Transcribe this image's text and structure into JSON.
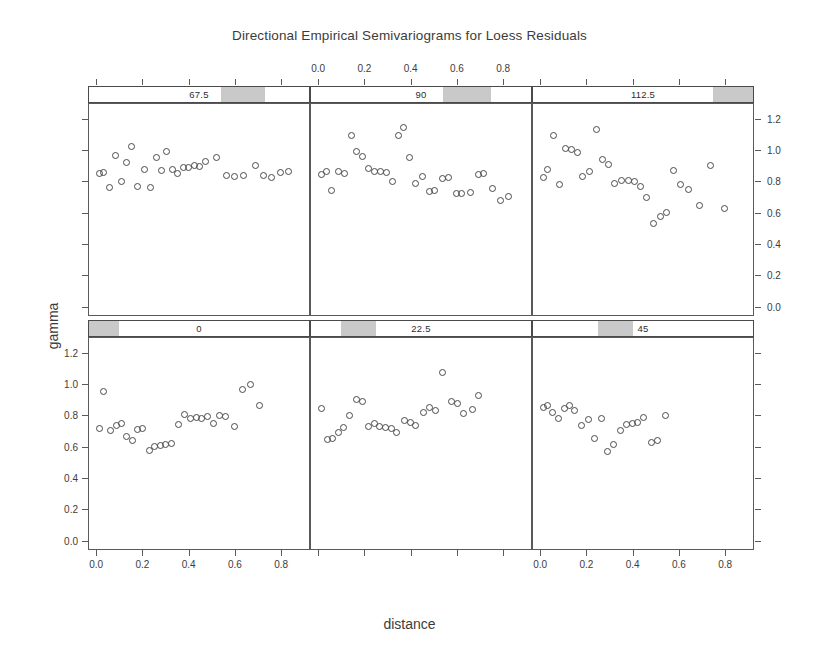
{
  "chart_data": {
    "type": "scatter",
    "title": "Directional Empirical Semivariograms for Loess Residuals",
    "xlabel": "distance",
    "ylabel": "gamma",
    "layout": {
      "rows": 2,
      "cols": 3,
      "grid": false,
      "legend": "none"
    },
    "xlim": [
      -0.035,
      0.925
    ],
    "ylim": [
      -0.06,
      1.3
    ],
    "xticks": [
      0.0,
      0.2,
      0.4,
      0.6,
      0.8
    ],
    "xticklabels": [
      "0.0",
      "0.2",
      "0.4",
      "0.6",
      "0.8"
    ],
    "yticks": [
      0.0,
      0.2,
      0.4,
      0.6,
      0.8,
      1.0,
      1.2
    ],
    "yticklabels": [
      "0.0",
      "0.2",
      "0.4",
      "0.6",
      "0.8",
      "1.0",
      "1.2"
    ],
    "axis_sides": {
      "x_top_panel": "90",
      "x_bottom_panels": [
        "0",
        "45"
      ],
      "y_left_panel": "0",
      "y_right_panel": "112.5"
    },
    "panels": [
      {
        "strip_label": "67.5",
        "row": 0,
        "col": 0,
        "strip_fill_start": 0.6,
        "strip_fill_end": 0.8,
        "points": [
          {
            "x": 0.01,
            "y": 0.855
          },
          {
            "x": 0.028,
            "y": 0.858
          },
          {
            "x": 0.055,
            "y": 0.762
          },
          {
            "x": 0.082,
            "y": 0.968
          },
          {
            "x": 0.105,
            "y": 0.802
          },
          {
            "x": 0.128,
            "y": 0.922
          },
          {
            "x": 0.152,
            "y": 1.025
          },
          {
            "x": 0.175,
            "y": 0.768
          },
          {
            "x": 0.205,
            "y": 0.88
          },
          {
            "x": 0.232,
            "y": 0.76
          },
          {
            "x": 0.258,
            "y": 0.952
          },
          {
            "x": 0.282,
            "y": 0.872
          },
          {
            "x": 0.305,
            "y": 0.995
          },
          {
            "x": 0.33,
            "y": 0.875
          },
          {
            "x": 0.352,
            "y": 0.852
          },
          {
            "x": 0.378,
            "y": 0.888
          },
          {
            "x": 0.4,
            "y": 0.892
          },
          {
            "x": 0.425,
            "y": 0.905
          },
          {
            "x": 0.448,
            "y": 0.9
          },
          {
            "x": 0.472,
            "y": 0.93
          },
          {
            "x": 0.52,
            "y": 0.955
          },
          {
            "x": 0.565,
            "y": 0.838
          },
          {
            "x": 0.6,
            "y": 0.832
          },
          {
            "x": 0.64,
            "y": 0.838
          },
          {
            "x": 0.69,
            "y": 0.905
          },
          {
            "x": 0.728,
            "y": 0.842
          },
          {
            "x": 0.762,
            "y": 0.828
          },
          {
            "x": 0.8,
            "y": 0.858
          },
          {
            "x": 0.835,
            "y": 0.862
          }
        ]
      },
      {
        "strip_label": "90",
        "row": 0,
        "col": 1,
        "strip_fill_start": 0.6,
        "strip_fill_end": 0.82,
        "points": [
          {
            "x": 0.012,
            "y": 0.845
          },
          {
            "x": 0.032,
            "y": 0.862
          },
          {
            "x": 0.055,
            "y": 0.742
          },
          {
            "x": 0.085,
            "y": 0.868
          },
          {
            "x": 0.11,
            "y": 0.855
          },
          {
            "x": 0.14,
            "y": 1.1
          },
          {
            "x": 0.165,
            "y": 0.995
          },
          {
            "x": 0.19,
            "y": 0.962
          },
          {
            "x": 0.218,
            "y": 0.882
          },
          {
            "x": 0.242,
            "y": 0.868
          },
          {
            "x": 0.268,
            "y": 0.862
          },
          {
            "x": 0.295,
            "y": 0.858
          },
          {
            "x": 0.32,
            "y": 0.8
          },
          {
            "x": 0.345,
            "y": 1.095
          },
          {
            "x": 0.368,
            "y": 1.15
          },
          {
            "x": 0.395,
            "y": 0.952
          },
          {
            "x": 0.42,
            "y": 0.79
          },
          {
            "x": 0.45,
            "y": 0.835
          },
          {
            "x": 0.482,
            "y": 0.738
          },
          {
            "x": 0.505,
            "y": 0.742
          },
          {
            "x": 0.54,
            "y": 0.82
          },
          {
            "x": 0.565,
            "y": 0.828
          },
          {
            "x": 0.598,
            "y": 0.722
          },
          {
            "x": 0.62,
            "y": 0.725
          },
          {
            "x": 0.66,
            "y": 0.732
          },
          {
            "x": 0.695,
            "y": 0.845
          },
          {
            "x": 0.718,
            "y": 0.855
          },
          {
            "x": 0.755,
            "y": 0.755
          },
          {
            "x": 0.79,
            "y": 0.68
          },
          {
            "x": 0.825,
            "y": 0.705
          }
        ]
      },
      {
        "strip_label": "112.5",
        "row": 0,
        "col": 2,
        "strip_fill_start": 0.82,
        "strip_fill_end": 1.0,
        "points": [
          {
            "x": 0.01,
            "y": 0.828
          },
          {
            "x": 0.03,
            "y": 0.88
          },
          {
            "x": 0.055,
            "y": 1.098
          },
          {
            "x": 0.082,
            "y": 0.78
          },
          {
            "x": 0.105,
            "y": 1.012
          },
          {
            "x": 0.132,
            "y": 1.005
          },
          {
            "x": 0.158,
            "y": 0.985
          },
          {
            "x": 0.182,
            "y": 0.832
          },
          {
            "x": 0.21,
            "y": 0.868
          },
          {
            "x": 0.24,
            "y": 1.138
          },
          {
            "x": 0.268,
            "y": 0.942
          },
          {
            "x": 0.295,
            "y": 0.912
          },
          {
            "x": 0.322,
            "y": 0.79
          },
          {
            "x": 0.352,
            "y": 0.805
          },
          {
            "x": 0.382,
            "y": 0.805
          },
          {
            "x": 0.408,
            "y": 0.8
          },
          {
            "x": 0.435,
            "y": 0.768
          },
          {
            "x": 0.462,
            "y": 0.7
          },
          {
            "x": 0.492,
            "y": 0.528
          },
          {
            "x": 0.522,
            "y": 0.572
          },
          {
            "x": 0.548,
            "y": 0.602
          },
          {
            "x": 0.578,
            "y": 0.872
          },
          {
            "x": 0.608,
            "y": 0.782
          },
          {
            "x": 0.645,
            "y": 0.752
          },
          {
            "x": 0.69,
            "y": 0.645
          },
          {
            "x": 0.74,
            "y": 0.905
          },
          {
            "x": 0.8,
            "y": 0.628
          }
        ]
      },
      {
        "strip_label": "0",
        "row": 1,
        "col": 0,
        "strip_fill_start": 0.0,
        "strip_fill_end": 0.135,
        "points": [
          {
            "x": 0.01,
            "y": 0.718
          },
          {
            "x": 0.03,
            "y": 0.952
          },
          {
            "x": 0.058,
            "y": 0.705
          },
          {
            "x": 0.085,
            "y": 0.735
          },
          {
            "x": 0.108,
            "y": 0.752
          },
          {
            "x": 0.13,
            "y": 0.668
          },
          {
            "x": 0.155,
            "y": 0.638
          },
          {
            "x": 0.178,
            "y": 0.712
          },
          {
            "x": 0.2,
            "y": 0.715
          },
          {
            "x": 0.228,
            "y": 0.578
          },
          {
            "x": 0.252,
            "y": 0.598
          },
          {
            "x": 0.275,
            "y": 0.608
          },
          {
            "x": 0.298,
            "y": 0.612
          },
          {
            "x": 0.325,
            "y": 0.622
          },
          {
            "x": 0.355,
            "y": 0.745
          },
          {
            "x": 0.382,
            "y": 0.805
          },
          {
            "x": 0.408,
            "y": 0.782
          },
          {
            "x": 0.432,
            "y": 0.79
          },
          {
            "x": 0.458,
            "y": 0.782
          },
          {
            "x": 0.482,
            "y": 0.795
          },
          {
            "x": 0.508,
            "y": 0.752
          },
          {
            "x": 0.535,
            "y": 0.802
          },
          {
            "x": 0.562,
            "y": 0.795
          },
          {
            "x": 0.598,
            "y": 0.732
          },
          {
            "x": 0.635,
            "y": 0.968
          },
          {
            "x": 0.668,
            "y": 0.998
          },
          {
            "x": 0.71,
            "y": 0.862
          }
        ]
      },
      {
        "strip_label": "22.5",
        "row": 1,
        "col": 1,
        "strip_fill_start": 0.135,
        "strip_fill_end": 0.295,
        "points": [
          {
            "x": 0.012,
            "y": 0.845
          },
          {
            "x": 0.035,
            "y": 0.648
          },
          {
            "x": 0.058,
            "y": 0.652
          },
          {
            "x": 0.085,
            "y": 0.692
          },
          {
            "x": 0.108,
            "y": 0.725
          },
          {
            "x": 0.135,
            "y": 0.802
          },
          {
            "x": 0.162,
            "y": 0.902
          },
          {
            "x": 0.188,
            "y": 0.888
          },
          {
            "x": 0.218,
            "y": 0.728
          },
          {
            "x": 0.242,
            "y": 0.752
          },
          {
            "x": 0.265,
            "y": 0.728
          },
          {
            "x": 0.292,
            "y": 0.722
          },
          {
            "x": 0.315,
            "y": 0.718
          },
          {
            "x": 0.34,
            "y": 0.688
          },
          {
            "x": 0.372,
            "y": 0.768
          },
          {
            "x": 0.398,
            "y": 0.758
          },
          {
            "x": 0.422,
            "y": 0.735
          },
          {
            "x": 0.455,
            "y": 0.822
          },
          {
            "x": 0.482,
            "y": 0.855
          },
          {
            "x": 0.508,
            "y": 0.832
          },
          {
            "x": 0.54,
            "y": 1.075
          },
          {
            "x": 0.578,
            "y": 0.888
          },
          {
            "x": 0.605,
            "y": 0.88
          },
          {
            "x": 0.632,
            "y": 0.815
          },
          {
            "x": 0.668,
            "y": 0.842
          },
          {
            "x": 0.698,
            "y": 0.928
          }
        ]
      },
      {
        "strip_label": "45",
        "row": 1,
        "col": 2,
        "strip_fill_start": 0.295,
        "strip_fill_end": 0.455,
        "points": [
          {
            "x": 0.01,
            "y": 0.852
          },
          {
            "x": 0.028,
            "y": 0.868
          },
          {
            "x": 0.052,
            "y": 0.822
          },
          {
            "x": 0.075,
            "y": 0.778
          },
          {
            "x": 0.102,
            "y": 0.848
          },
          {
            "x": 0.125,
            "y": 0.862
          },
          {
            "x": 0.148,
            "y": 0.832
          },
          {
            "x": 0.178,
            "y": 0.738
          },
          {
            "x": 0.205,
            "y": 0.772
          },
          {
            "x": 0.232,
            "y": 0.652
          },
          {
            "x": 0.262,
            "y": 0.778
          },
          {
            "x": 0.292,
            "y": 0.568
          },
          {
            "x": 0.318,
            "y": 0.612
          },
          {
            "x": 0.348,
            "y": 0.705
          },
          {
            "x": 0.372,
            "y": 0.742
          },
          {
            "x": 0.398,
            "y": 0.752
          },
          {
            "x": 0.422,
            "y": 0.758
          },
          {
            "x": 0.448,
            "y": 0.788
          },
          {
            "x": 0.482,
            "y": 0.625
          },
          {
            "x": 0.508,
            "y": 0.638
          },
          {
            "x": 0.545,
            "y": 0.802
          }
        ]
      }
    ]
  }
}
